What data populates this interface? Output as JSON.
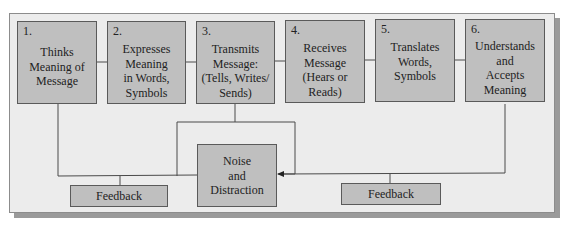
{
  "diagram": {
    "steps": [
      {
        "number": "1.",
        "label": "Thinks Meaning of Message",
        "lines": [
          "Thinks",
          "Meaning of",
          "Message"
        ]
      },
      {
        "number": "2.",
        "label": "Expresses Meaning in Words, Symbols",
        "lines": [
          "Expresses",
          "Meaning",
          "in Words,",
          "Symbols"
        ]
      },
      {
        "number": "3.",
        "label": "Transmits Message: (Tells, Writes/ Sends)",
        "lines": [
          "Transmits",
          "Message:",
          "(Tells, Writes/",
          "Sends)"
        ]
      },
      {
        "number": "4.",
        "label": "Receives Message (Hears or Reads)",
        "lines": [
          "Receives",
          "Message",
          "(Hears or",
          "Reads)"
        ]
      },
      {
        "number": "5.",
        "label": "Translates Words, Symbols",
        "lines": [
          "Translates",
          "Words,",
          "Symbols"
        ]
      },
      {
        "number": "6.",
        "label": "Understands and Accepts Meaning",
        "lines": [
          "Understands",
          "and",
          "Accepts",
          "Meaning"
        ]
      }
    ],
    "noise": {
      "lines": [
        "Noise",
        "and",
        "Distraction"
      ]
    },
    "feedback_left": {
      "label": "Feedback"
    },
    "feedback_right": {
      "label": "Feedback"
    },
    "colors": {
      "box_fill": "#bfbfbf",
      "panel_fill": "#ececec",
      "line": "#4a4a4a"
    }
  }
}
